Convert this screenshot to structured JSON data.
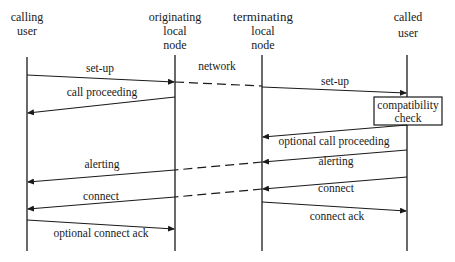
{
  "diagram": {
    "type": "message-sequence-chart",
    "participants": [
      {
        "id": "calling_user",
        "lines": [
          "calling",
          "user"
        ],
        "x": 27
      },
      {
        "id": "originating_node",
        "lines": [
          "originating",
          "local",
          "node"
        ],
        "x": 175
      },
      {
        "id": "terminating_node",
        "lines": [
          "terminating",
          "local",
          "node"
        ],
        "x": 262
      },
      {
        "id": "called_user",
        "lines": [
          "called",
          "user"
        ],
        "x": 407
      }
    ],
    "network_label": "network",
    "process_box": {
      "lines": [
        "compatibility",
        "check"
      ],
      "participant": "called_user"
    },
    "messages": [
      {
        "label": "set-up",
        "from": "calling_user",
        "to": "originating_node"
      },
      {
        "label": "",
        "from": "originating_node",
        "to": "terminating_node",
        "style": "dashed"
      },
      {
        "label": "set-up",
        "from": "terminating_node",
        "to": "called_user"
      },
      {
        "label": "call proceeding",
        "from": "originating_node",
        "to": "calling_user"
      },
      {
        "label": "optional call proceeding",
        "from": "called_user",
        "to": "terminating_node"
      },
      {
        "label": "alerting",
        "from": "called_user",
        "to": "terminating_node"
      },
      {
        "label": "",
        "from": "terminating_node",
        "to": "originating_node",
        "style": "dashed"
      },
      {
        "label": "alerting",
        "from": "originating_node",
        "to": "calling_user"
      },
      {
        "label": "connect",
        "from": "called_user",
        "to": "terminating_node"
      },
      {
        "label": "",
        "from": "terminating_node",
        "to": "originating_node",
        "style": "dashed"
      },
      {
        "label": "connect",
        "from": "originating_node",
        "to": "calling_user"
      },
      {
        "label": "connect ack",
        "from": "terminating_node",
        "to": "called_user"
      },
      {
        "label": "optional connect ack",
        "from": "calling_user",
        "to": "originating_node"
      }
    ]
  }
}
